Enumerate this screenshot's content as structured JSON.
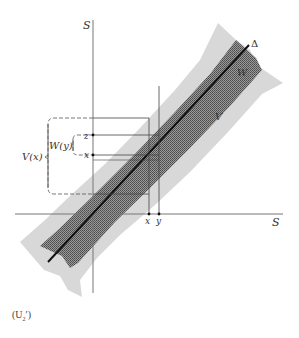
{
  "figure": {
    "axis_labels": {
      "vertical": "S",
      "horizontal": "S"
    },
    "diagonal_label": "Δ",
    "region_labels": {
      "outer": "V",
      "inner": "W"
    },
    "point_labels": {
      "z": "z",
      "x_left": "x",
      "x_axis": "x",
      "y_axis": "y"
    },
    "bracket_labels": {
      "outer": "V(x)",
      "inner": "W(y)"
    },
    "colors": {
      "outer_region": "#d9d9d9",
      "inner_region": "#7a7a7a",
      "diagonal": "#111111",
      "axes": "#777777",
      "lines": "#444444"
    }
  },
  "caption": {
    "prefix": "(U",
    "subscript": "2",
    "suffix": "′)"
  }
}
